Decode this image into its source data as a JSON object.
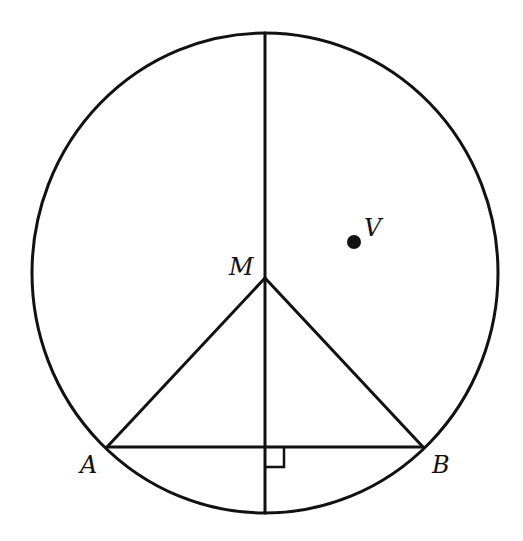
{
  "diagram": {
    "type": "geometry",
    "colors": {
      "stroke": "#111111",
      "background": "#ffffff"
    },
    "labels": {
      "M": "M",
      "V": "V",
      "A": "A",
      "B": "B"
    },
    "points": {
      "M": {
        "x": 265,
        "y": 278
      },
      "V": {
        "x": 354,
        "y": 242
      },
      "A": {
        "x": 107,
        "y": 447
      },
      "B": {
        "x": 423,
        "y": 447
      },
      "top": {
        "x": 265,
        "y": 33
      },
      "bottom": {
        "x": 265,
        "y": 513
      },
      "foot": {
        "x": 265,
        "y": 447
      }
    },
    "circle": {
      "cx": 265,
      "cy": 273,
      "rx": 233,
      "ry": 240
    },
    "marks": {
      "right_angle": "right-angle marker at intersection of vertical segment and chord AB"
    }
  }
}
